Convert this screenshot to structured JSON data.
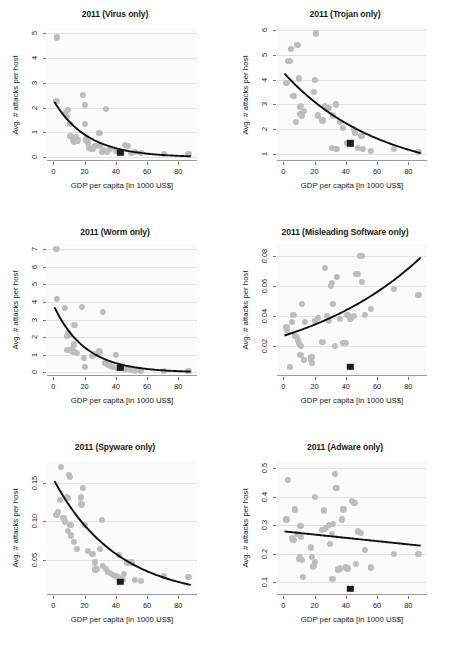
{
  "figure": {
    "axis_labels": {
      "x": "GDP per capita [in 1000 US$]",
      "y": "Avg. # attacks per host"
    },
    "colors": {
      "point": "#bdbdbd",
      "fit_line": "#111111",
      "highlight_marker": "#1c1c1c",
      "grid": "#e2e2e2",
      "panel_background": "#fbfbfb"
    },
    "highlight_marker_note": "black square at GDP per capita = 43"
  },
  "chart_data": [
    {
      "type": "scatter",
      "panel": 1,
      "title": "2011 (Virus only)",
      "xlabel": "GDP per capita [in 1000 US$]",
      "ylabel": "Avg. # attacks per host",
      "xlim": [
        -4,
        92
      ],
      "ylim": [
        -0.15,
        5.2
      ],
      "xticks": [
        0,
        20,
        40,
        60,
        80
      ],
      "yticks": [
        0,
        1,
        2,
        3,
        4,
        5
      ],
      "grid": true,
      "legend": "none",
      "fit": {
        "shape": "exponential-decay",
        "y_at_xmin": 2.22,
        "y_at_xmax": 0.04
      },
      "highlight": {
        "x": 43,
        "y": 0.18
      },
      "points": [
        [
          2.0,
          2.28
        ],
        [
          2.2,
          4.82
        ],
        [
          7.5,
          1.78
        ],
        [
          8.5,
          1.62
        ],
        [
          9.5,
          1.9
        ],
        [
          10.5,
          1.35
        ],
        [
          11.0,
          0.86
        ],
        [
          12.0,
          0.82
        ],
        [
          12.5,
          0.72
        ],
        [
          13.0,
          0.62
        ],
        [
          14.5,
          0.8
        ],
        [
          15.5,
          0.68
        ],
        [
          19.0,
          2.5
        ],
        [
          20.0,
          2.12
        ],
        [
          20.5,
          1.35
        ],
        [
          21.0,
          0.72
        ],
        [
          22.0,
          0.6
        ],
        [
          23.0,
          0.38
        ],
        [
          24.0,
          0.33
        ],
        [
          25.5,
          0.36
        ],
        [
          27.0,
          0.45
        ],
        [
          29.5,
          0.97
        ],
        [
          30.0,
          0.48
        ],
        [
          31.0,
          0.22
        ],
        [
          32.5,
          0.3
        ],
        [
          33.5,
          1.95
        ],
        [
          34.5,
          0.2
        ],
        [
          36.0,
          0.33
        ],
        [
          40.0,
          0.25
        ],
        [
          42.0,
          0.2
        ],
        [
          44.0,
          0.18
        ],
        [
          46.0,
          0.5
        ],
        [
          48.0,
          0.45
        ],
        [
          50.0,
          0.17
        ],
        [
          52.0,
          0.2
        ],
        [
          56.0,
          0.17
        ],
        [
          71.0,
          0.14
        ],
        [
          86.5,
          0.12
        ]
      ]
    },
    {
      "type": "scatter",
      "panel": 2,
      "title": "2011 (Trojan only)",
      "xlabel": "GDP per capita [in 1000 US$]",
      "ylabel": "Avg. # attacks per host",
      "xlim": [
        -4,
        92
      ],
      "ylim": [
        0.7,
        6.1
      ],
      "xticks": [
        0,
        20,
        40,
        60,
        80
      ],
      "yticks": [
        1,
        2,
        3,
        4,
        5,
        6
      ],
      "grid": true,
      "legend": "none",
      "fit": {
        "shape": "exponential-decay",
        "y_at_xmin": 4.25,
        "y_at_xmax": 1.02
      },
      "highlight": {
        "x": 43,
        "y": 1.42
      },
      "points": [
        [
          2.0,
          3.88
        ],
        [
          3.0,
          4.78
        ],
        [
          4.5,
          4.78
        ],
        [
          5.0,
          5.25
        ],
        [
          6.5,
          3.35
        ],
        [
          8.0,
          2.3
        ],
        [
          9.0,
          5.4
        ],
        [
          10.0,
          4.05
        ],
        [
          10.5,
          2.9
        ],
        [
          11.0,
          2.6
        ],
        [
          11.5,
          2.95
        ],
        [
          12.0,
          2.55
        ],
        [
          13.0,
          2.75
        ],
        [
          19.5,
          3.5
        ],
        [
          20.0,
          4.0
        ],
        [
          21.0,
          5.88
        ],
        [
          22.0,
          2.55
        ],
        [
          25.0,
          2.35
        ],
        [
          26.5,
          2.95
        ],
        [
          28.0,
          2.8
        ],
        [
          29.0,
          2.85
        ],
        [
          31.0,
          1.22
        ],
        [
          32.0,
          2.55
        ],
        [
          33.5,
          3.0
        ],
        [
          34.0,
          1.2
        ],
        [
          36.0,
          2.28
        ],
        [
          38.0,
          2.05
        ],
        [
          41.0,
          1.45
        ],
        [
          43.0,
          1.45
        ],
        [
          45.0,
          2.0
        ],
        [
          46.0,
          1.85
        ],
        [
          48.0,
          1.22
        ],
        [
          50.0,
          1.72
        ],
        [
          51.0,
          1.2
        ],
        [
          56.0,
          1.12
        ],
        [
          71.0,
          1.18
        ],
        [
          86.5,
          1.08
        ]
      ]
    },
    {
      "type": "scatter",
      "panel": 3,
      "title": "2011 (Worm only)",
      "xlabel": "GDP per capita [in 1000 US$]",
      "ylabel": "Avg. # attacks per host",
      "xlim": [
        -4,
        92
      ],
      "ylim": [
        -0.2,
        7.3
      ],
      "xticks": [
        0,
        20,
        40,
        60,
        80
      ],
      "yticks": [
        0,
        1,
        2,
        3,
        4,
        5,
        6,
        7
      ],
      "grid": true,
      "legend": "none",
      "fit": {
        "shape": "exponential-decay",
        "y_at_xmin": 3.7,
        "y_at_xmax": 0.05
      },
      "highlight": {
        "x": 43,
        "y": 0.25
      },
      "points": [
        [
          2.0,
          7.02
        ],
        [
          2.5,
          4.2
        ],
        [
          7.5,
          3.68
        ],
        [
          8.5,
          2.1
        ],
        [
          9.0,
          1.28
        ],
        [
          9.5,
          2.25
        ],
        [
          10.5,
          2.15
        ],
        [
          11.0,
          1.3
        ],
        [
          12.0,
          1.35
        ],
        [
          12.5,
          1.2
        ],
        [
          13.0,
          1.6
        ],
        [
          13.5,
          2.7
        ],
        [
          14.0,
          1.15
        ],
        [
          15.0,
          1.1
        ],
        [
          18.5,
          3.72
        ],
        [
          19.5,
          0.85
        ],
        [
          20.0,
          0.3
        ],
        [
          25.0,
          0.95
        ],
        [
          27.0,
          1.05
        ],
        [
          29.0,
          1.2
        ],
        [
          30.0,
          1.15
        ],
        [
          32.0,
          3.45
        ],
        [
          33.0,
          0.55
        ],
        [
          35.0,
          0.45
        ],
        [
          36.5,
          0.4
        ],
        [
          38.0,
          0.3
        ],
        [
          40.0,
          1.0
        ],
        [
          41.0,
          0.25
        ],
        [
          43.0,
          0.25
        ],
        [
          45.0,
          0.2
        ],
        [
          47.0,
          0.18
        ],
        [
          50.0,
          0.15
        ],
        [
          52.0,
          0.12
        ],
        [
          56.0,
          0.12
        ],
        [
          71.0,
          0.1
        ],
        [
          86.5,
          0.08
        ]
      ]
    },
    {
      "type": "scatter",
      "panel": 4,
      "title": "2011 (Misleading Software only)",
      "xlabel": "GDP per capita [in 1000 US$]",
      "ylabel": "Avg. # attacks per host",
      "xlim": [
        -4,
        92
      ],
      "ylim": [
        0.0,
        0.088
      ],
      "xticks": [
        0,
        20,
        40,
        60,
        80
      ],
      "yticks": [
        0.02,
        0.04,
        0.06,
        0.08
      ],
      "grid": true,
      "legend": "none",
      "fit": {
        "shape": "exponential-growth",
        "y_at_xmin": 0.027,
        "y_at_xmax": 0.079
      },
      "highlight": {
        "x": 43,
        "y": 0.006
      },
      "points": [
        [
          2.0,
          0.033
        ],
        [
          2.5,
          0.031
        ],
        [
          4.0,
          0.006
        ],
        [
          5.5,
          0.036
        ],
        [
          6.5,
          0.041
        ],
        [
          7.5,
          0.027
        ],
        [
          8.5,
          0.026
        ],
        [
          9.5,
          0.024
        ],
        [
          10.0,
          0.022
        ],
        [
          10.5,
          0.021
        ],
        [
          11.0,
          0.014
        ],
        [
          11.5,
          0.02
        ],
        [
          12.0,
          0.048
        ],
        [
          13.0,
          0.011
        ],
        [
          14.0,
          0.036
        ],
        [
          17.5,
          0.011
        ],
        [
          18.0,
          0.013
        ],
        [
          18.5,
          0.009
        ],
        [
          20.0,
          0.037
        ],
        [
          22.0,
          0.039
        ],
        [
          25.0,
          0.023
        ],
        [
          26.5,
          0.072
        ],
        [
          28.0,
          0.04
        ],
        [
          29.0,
          0.037
        ],
        [
          30.5,
          0.06
        ],
        [
          31.0,
          0.062
        ],
        [
          32.0,
          0.048
        ],
        [
          33.0,
          0.02
        ],
        [
          34.5,
          0.066
        ],
        [
          36.0,
          0.038
        ],
        [
          38.0,
          0.022
        ],
        [
          40.0,
          0.022
        ],
        [
          41.0,
          0.041
        ],
        [
          43.0,
          0.038
        ],
        [
          45.0,
          0.04
        ],
        [
          46.5,
          0.068
        ],
        [
          47.5,
          0.068
        ],
        [
          49.0,
          0.08
        ],
        [
          50.0,
          0.08
        ],
        [
          50.5,
          0.063
        ],
        [
          52.0,
          0.041
        ],
        [
          56.0,
          0.045
        ],
        [
          71.0,
          0.058
        ],
        [
          86.5,
          0.054
        ]
      ]
    },
    {
      "type": "scatter",
      "panel": 5,
      "title": "2011 (Spyware only)",
      "xlabel": "GDP per capita [in 1000 US$]",
      "ylabel": "Avg. # attacks per host",
      "xlim": [
        -4,
        92
      ],
      "ylim": [
        0.005,
        0.178
      ],
      "xticks": [
        0,
        20,
        40,
        60,
        80
      ],
      "yticks": [
        0.05,
        0.1,
        0.15
      ],
      "grid": true,
      "legend": "none",
      "fit": {
        "shape": "exponential-decay",
        "y_at_xmin": 0.152,
        "y_at_xmax": 0.018
      },
      "highlight": {
        "x": 43,
        "y": 0.022
      },
      "points": [
        [
          2.0,
          0.108
        ],
        [
          3.0,
          0.112
        ],
        [
          4.5,
          0.128
        ],
        [
          5.0,
          0.17
        ],
        [
          6.5,
          0.105
        ],
        [
          7.5,
          0.1
        ],
        [
          8.5,
          0.132
        ],
        [
          9.0,
          0.13
        ],
        [
          9.5,
          0.088
        ],
        [
          10.0,
          0.16
        ],
        [
          10.5,
          0.157
        ],
        [
          11.0,
          0.095
        ],
        [
          11.5,
          0.082
        ],
        [
          13.0,
          0.074
        ],
        [
          15.0,
          0.065
        ],
        [
          17.5,
          0.131
        ],
        [
          18.0,
          0.122
        ],
        [
          19.0,
          0.143
        ],
        [
          20.0,
          0.095
        ],
        [
          22.0,
          0.062
        ],
        [
          25.0,
          0.058
        ],
        [
          26.5,
          0.047
        ],
        [
          27.0,
          0.038
        ],
        [
          28.0,
          0.039
        ],
        [
          30.0,
          0.065
        ],
        [
          31.0,
          0.102
        ],
        [
          32.0,
          0.043
        ],
        [
          33.5,
          0.039
        ],
        [
          35.0,
          0.035
        ],
        [
          36.5,
          0.033
        ],
        [
          38.0,
          0.031
        ],
        [
          40.0,
          0.03
        ],
        [
          41.0,
          0.028
        ],
        [
          42.0,
          0.057
        ],
        [
          43.0,
          0.026
        ],
        [
          44.5,
          0.025
        ],
        [
          45.0,
          0.032
        ],
        [
          47.0,
          0.047
        ],
        [
          50.0,
          0.047
        ],
        [
          52.0,
          0.024
        ],
        [
          56.0,
          0.023
        ],
        [
          71.0,
          0.03
        ],
        [
          86.5,
          0.028
        ]
      ]
    },
    {
      "type": "scatter",
      "panel": 6,
      "title": "2011 (Adware only)",
      "xlabel": "GDP per capita [in 1000 US$]",
      "ylabel": "Avg. # attacks per host",
      "xlim": [
        -4,
        92
      ],
      "ylim": [
        0.055,
        0.525
      ],
      "xticks": [
        0,
        20,
        40,
        60,
        80
      ],
      "yticks": [
        0.1,
        0.2,
        0.3,
        0.4,
        0.5
      ],
      "grid": true,
      "legend": "none",
      "fit": {
        "shape": "linear-decline",
        "y_at_xmin": 0.278,
        "y_at_xmax": 0.228
      },
      "highlight": {
        "x": 43,
        "y": 0.077
      },
      "points": [
        [
          2.0,
          0.32
        ],
        [
          3.0,
          0.458
        ],
        [
          5.5,
          0.255
        ],
        [
          6.5,
          0.248
        ],
        [
          7.5,
          0.355
        ],
        [
          9.0,
          0.268
        ],
        [
          10.0,
          0.183
        ],
        [
          10.5,
          0.188
        ],
        [
          11.0,
          0.298
        ],
        [
          11.5,
          0.258
        ],
        [
          12.0,
          0.178
        ],
        [
          12.5,
          0.118
        ],
        [
          17.5,
          0.222
        ],
        [
          18.5,
          0.188
        ],
        [
          19.0,
          0.155
        ],
        [
          19.5,
          0.158
        ],
        [
          20.0,
          0.4
        ],
        [
          20.5,
          0.172
        ],
        [
          24.5,
          0.282
        ],
        [
          26.0,
          0.352
        ],
        [
          26.5,
          0.288
        ],
        [
          27.5,
          0.29
        ],
        [
          29.0,
          0.302
        ],
        [
          30.0,
          0.235
        ],
        [
          31.0,
          0.268
        ],
        [
          31.5,
          0.112
        ],
        [
          32.0,
          0.305
        ],
        [
          33.0,
          0.48
        ],
        [
          33.5,
          0.43
        ],
        [
          34.0,
          0.43
        ],
        [
          35.0,
          0.145
        ],
        [
          36.0,
          0.148
        ],
        [
          37.5,
          0.32
        ],
        [
          38.5,
          0.355
        ],
        [
          40.0,
          0.152
        ],
        [
          41.0,
          0.148
        ],
        [
          44.0,
          0.385
        ],
        [
          45.5,
          0.378
        ],
        [
          46.5,
          0.165
        ],
        [
          48.0,
          0.278
        ],
        [
          49.5,
          0.272
        ],
        [
          52.0,
          0.212
        ],
        [
          56.0,
          0.152
        ],
        [
          71.0,
          0.198
        ],
        [
          86.5,
          0.2
        ]
      ]
    }
  ]
}
